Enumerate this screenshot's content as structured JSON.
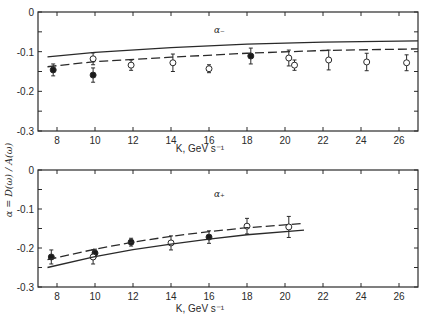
{
  "chart_data": [
    {
      "type": "scatter",
      "panel": "top",
      "title": "",
      "annotation": "α₋",
      "xlabel": "K, GeV s⁻¹",
      "ylabel": "α = D(ω) / A(ω)",
      "xlim": [
        7.0,
        27.0
      ],
      "ylim": [
        -0.3,
        0.0
      ],
      "xticks": [
        8,
        10,
        12,
        14,
        16,
        18,
        20,
        22,
        24,
        26
      ],
      "xtick_labels": [
        "8",
        "10",
        "12",
        "14",
        "16",
        "18",
        "20",
        "22",
        "24",
        "26"
      ],
      "yticks": [
        0,
        -0.1,
        -0.2,
        -0.3
      ],
      "ytick_labels": [
        "0",
        "-0.1",
        "-0.2",
        "-0.3"
      ],
      "grid": false,
      "series": [
        {
          "name": "filled points",
          "marker": "filled-circle",
          "x": [
            7.8,
            9.9,
            18.2
          ],
          "y": [
            -0.146,
            -0.159,
            -0.111
          ],
          "err": [
            0.015,
            0.018,
            0.02
          ]
        },
        {
          "name": "open points",
          "marker": "open-circle",
          "x": [
            9.9,
            11.9,
            14.1,
            16.0,
            20.2,
            20.5,
            22.3,
            24.3,
            26.4
          ],
          "y": [
            -0.118,
            -0.134,
            -0.128,
            -0.143,
            -0.116,
            -0.134,
            -0.121,
            -0.126,
            -0.128
          ],
          "err": [
            0.015,
            0.013,
            0.022,
            0.01,
            0.02,
            0.013,
            0.025,
            0.022,
            0.02
          ]
        },
        {
          "name": "solid curve",
          "style": "solid",
          "x": [
            7.5,
            10,
            14,
            18,
            22,
            27
          ],
          "y": [
            -0.113,
            -0.102,
            -0.09,
            -0.081,
            -0.076,
            -0.073
          ]
        },
        {
          "name": "dashed curve",
          "style": "dashed",
          "x": [
            7.5,
            10,
            14,
            18,
            22,
            27
          ],
          "y": [
            -0.138,
            -0.125,
            -0.114,
            -0.104,
            -0.097,
            -0.093
          ]
        }
      ]
    },
    {
      "type": "scatter",
      "panel": "bottom",
      "title": "",
      "annotation": "α₊",
      "xlabel": "K, GeV s⁻¹",
      "ylabel": "α = D(ω) / A(ω)",
      "xlim": [
        7.0,
        27.0
      ],
      "ylim": [
        -0.3,
        0.0
      ],
      "xticks": [
        8,
        10,
        12,
        14,
        16,
        18,
        20,
        22,
        24,
        26
      ],
      "xtick_labels": [
        "8",
        "10",
        "12",
        "14",
        "16",
        "18",
        "20",
        "22",
        "24",
        "26"
      ],
      "yticks": [
        0,
        -0.1,
        -0.2,
        -0.3
      ],
      "ytick_labels": [
        "0",
        "-0.1",
        "-0.2",
        "-0.3"
      ],
      "grid": false,
      "series": [
        {
          "name": "filled points",
          "marker": "filled-circle",
          "x": [
            7.7,
            10.0,
            11.9,
            16.0
          ],
          "y": [
            -0.223,
            -0.213,
            -0.185,
            -0.172
          ],
          "err": [
            0.018,
            0.01,
            0.01,
            0.016
          ]
        },
        {
          "name": "open points",
          "marker": "open-circle",
          "x": [
            9.9,
            14.0,
            18.0,
            20.2
          ],
          "y": [
            -0.223,
            -0.187,
            -0.144,
            -0.146
          ],
          "err": [
            0.018,
            0.018,
            0.02,
            0.027
          ]
        },
        {
          "name": "dashed curve",
          "style": "dashed",
          "x": [
            7.5,
            10,
            12,
            14,
            16,
            18,
            21
          ],
          "y": [
            -0.23,
            -0.203,
            -0.185,
            -0.17,
            -0.158,
            -0.148,
            -0.137
          ]
        },
        {
          "name": "solid curve",
          "style": "solid",
          "x": [
            7.5,
            10,
            12,
            14,
            16,
            18,
            21
          ],
          "y": [
            -0.25,
            -0.222,
            -0.204,
            -0.19,
            -0.177,
            -0.166,
            -0.154
          ]
        }
      ]
    }
  ]
}
